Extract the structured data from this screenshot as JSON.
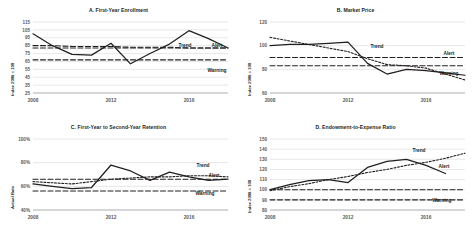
{
  "figure": {
    "panel_count": 4,
    "x_tick_labels": [
      "2008",
      "2012",
      "2016"
    ],
    "series_labels": {
      "trend": "Trend",
      "alert": "Alert",
      "warning": "Warning"
    },
    "colors": {
      "actual": "#231f20",
      "trend": "#231f20",
      "alert": "#231f20",
      "warning": "#231f20",
      "grid": "#d6d7d8",
      "tick_text": "#58595b"
    }
  },
  "chart_data": [
    {
      "type": "line",
      "title": "A. First-Year Enrollment",
      "xlabel": "",
      "ylabel": "Index 2008 = 100",
      "ylim": [
        25,
        115
      ],
      "yticks": [
        25,
        35,
        45,
        55,
        65,
        75,
        85,
        95,
        105,
        115
      ],
      "ytick_labels": [
        "25",
        "35",
        "45",
        "55",
        "65",
        "75",
        "85",
        "95",
        "105",
        "115"
      ],
      "xlim": [
        2008,
        2018
      ],
      "xticks": [
        2008,
        2012,
        2016
      ],
      "xtick_labels": [
        "2008",
        "2012",
        "2016"
      ],
      "grid": true,
      "legend": "inline-right",
      "x": [
        2008,
        2009,
        2010,
        2011,
        2012,
        2013,
        2014,
        2015,
        2016,
        2017,
        2018
      ],
      "series": [
        {
          "name": "Actual",
          "style": "solid",
          "values": [
            100,
            85,
            74,
            73,
            88,
            62,
            75,
            87,
            104,
            94,
            82
          ]
        },
        {
          "name": "Trend",
          "style": "dashed",
          "values": [
            85,
            85,
            84,
            84,
            84,
            83,
            83,
            83,
            82,
            82,
            82
          ]
        },
        {
          "name": "Alert",
          "style": "dashed",
          "values": [
            82,
            82,
            82,
            82,
            82,
            82,
            82,
            82,
            82,
            82,
            82
          ]
        },
        {
          "name": "Warning",
          "style": "dashed",
          "values": [
            67,
            67,
            67,
            67,
            67,
            67,
            67,
            67,
            67,
            67,
            67
          ]
        }
      ],
      "annotations": [
        {
          "text": "Trend",
          "series": "Trend"
        },
        {
          "text": "Alert",
          "series": "Alert"
        },
        {
          "text": "Warning",
          "series": "Warning"
        }
      ]
    },
    {
      "type": "line",
      "title": "B. Market Price",
      "xlabel": "",
      "ylabel": "Index 2008 = 100",
      "ylim": [
        60,
        120
      ],
      "yticks": [
        60,
        80,
        100,
        120
      ],
      "ytick_labels": [
        "60",
        "80",
        "100",
        "120"
      ],
      "xlim": [
        2008,
        2018
      ],
      "xticks": [
        2008,
        2012,
        2016
      ],
      "xtick_labels": [
        "2008",
        "2012",
        "2016"
      ],
      "grid": true,
      "legend": "inline-right",
      "x": [
        2008,
        2009,
        2010,
        2011,
        2012,
        2013,
        2014,
        2015,
        2016,
        2017,
        2018
      ],
      "series": [
        {
          "name": "Actual",
          "style": "solid",
          "values": [
            100,
            101,
            101,
            102,
            103,
            85,
            76,
            80,
            79,
            77,
            75
          ]
        },
        {
          "name": "Trend",
          "style": "dotted",
          "values": [
            107,
            104,
            101,
            98,
            95,
            89,
            84,
            83,
            81,
            76,
            71
          ]
        },
        {
          "name": "Alert",
          "style": "dashed",
          "values": [
            90,
            90,
            90,
            90,
            90,
            90,
            90,
            90,
            90,
            90,
            90
          ]
        },
        {
          "name": "Warning",
          "style": "dashed",
          "values": [
            83,
            83,
            83,
            83,
            83,
            83,
            83,
            83,
            83,
            83,
            83
          ]
        }
      ],
      "annotations": [
        {
          "text": "Trend",
          "series": "Trend"
        },
        {
          "text": "Alert",
          "series": "Alert"
        },
        {
          "text": "Warning",
          "series": "Warning"
        }
      ]
    },
    {
      "type": "line",
      "title": "C. First-Year to Second-Year Retention",
      "xlabel": "",
      "ylabel": "Actual Rate",
      "ylim": [
        40,
        100
      ],
      "yticks": [
        40,
        60,
        80,
        100
      ],
      "ytick_labels": [
        "40%",
        "60%",
        "80%",
        "100%"
      ],
      "xlim": [
        2008,
        2018
      ],
      "xticks": [
        2008,
        2012,
        2016
      ],
      "xtick_labels": [
        "2008",
        "2012",
        "2016"
      ],
      "grid": true,
      "legend": "inline-right",
      "x": [
        2008,
        2009,
        2010,
        2011,
        2012,
        2013,
        2014,
        2015,
        2016,
        2017,
        2018
      ],
      "series": [
        {
          "name": "Actual",
          "style": "solid",
          "values": [
            62,
            60,
            58,
            59,
            78,
            73,
            65,
            72,
            68,
            65,
            66
          ]
        },
        {
          "name": "Trend",
          "style": "dotted",
          "values": [
            64,
            63,
            62,
            64,
            66,
            67,
            68,
            68,
            69,
            69,
            68
          ]
        },
        {
          "name": "Alert",
          "style": "dashed",
          "values": [
            66,
            66,
            66,
            66,
            66,
            66,
            66,
            66,
            66,
            66,
            66
          ]
        },
        {
          "name": "Warning",
          "style": "dashed",
          "values": [
            56,
            56,
            56,
            56,
            56,
            56,
            56,
            56,
            56,
            56,
            56
          ]
        }
      ],
      "annotations": [
        {
          "text": "Trend",
          "series": "Trend"
        },
        {
          "text": "Alert",
          "series": "Alert"
        },
        {
          "text": "Warning",
          "series": "Warning"
        }
      ]
    },
    {
      "type": "line",
      "title": "D. Endowment-to-Expense Ratio",
      "xlabel": "",
      "ylabel": "Index 2008 = 100",
      "ylim": [
        80,
        150
      ],
      "yticks": [
        80,
        90,
        100,
        110,
        120,
        130,
        140,
        150
      ],
      "ytick_labels": [
        "80",
        "90",
        "100",
        "110",
        "120",
        "130",
        "140",
        "150"
      ],
      "xlim": [
        2008,
        2018
      ],
      "xticks": [
        2008,
        2012,
        2016
      ],
      "xtick_labels": [
        "2008",
        "2012",
        "2016"
      ],
      "grid": true,
      "legend": "inline-right",
      "x": [
        2008,
        2009,
        2010,
        2011,
        2012,
        2013,
        2014,
        2015,
        2016,
        2017,
        2018
      ],
      "series": [
        {
          "name": "Actual",
          "style": "solid",
          "values": [
            100,
            105,
            109,
            110,
            107,
            122,
            128,
            130,
            124,
            116,
            null
          ]
        },
        {
          "name": "Trend",
          "style": "dotted",
          "values": [
            99,
            103,
            106,
            110,
            113,
            117,
            120,
            124,
            127,
            131,
            136
          ]
        },
        {
          "name": "Alert",
          "style": "dashed",
          "values": [
            100,
            100,
            100,
            100,
            100,
            100,
            100,
            100,
            100,
            100,
            100
          ]
        },
        {
          "name": "Warning",
          "style": "dashed",
          "values": [
            90,
            90,
            90,
            90,
            90,
            90,
            90,
            90,
            90,
            90,
            90
          ]
        }
      ],
      "annotations": [
        {
          "text": "Trend",
          "series": "Trend"
        },
        {
          "text": "Alert",
          "series": "Alert"
        },
        {
          "text": "Warning",
          "series": "Warning"
        }
      ]
    }
  ]
}
